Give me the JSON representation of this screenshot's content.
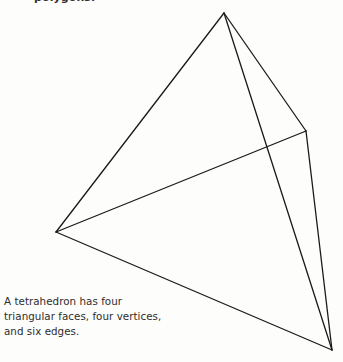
{
  "page": {
    "background_color": "#fdfdfc",
    "width": 343,
    "height": 362
  },
  "heading": {
    "text": "polygons.",
    "note": "clipped at top edge of image"
  },
  "figure": {
    "name": "tetrahedron-wireframe",
    "stroke_color": "#1a1a1a",
    "stroke_width": 1.3,
    "vertices": {
      "apex": {
        "label": "apex",
        "x": 224,
        "y": 13
      },
      "left": {
        "label": "left",
        "x": 56,
        "y": 232
      },
      "right": {
        "label": "right",
        "x": 306,
        "y": 131
      },
      "bottom_right": {
        "label": "bottom-right",
        "x": 332,
        "y": 350
      }
    },
    "edges": [
      {
        "name": "apex-to-left",
        "from": "apex",
        "to": "left"
      },
      {
        "name": "apex-to-right",
        "from": "apex",
        "to": "right"
      },
      {
        "name": "apex-to-bottom-right",
        "from": "apex",
        "to": "bottom_right"
      },
      {
        "name": "left-to-right",
        "from": "left",
        "to": "right"
      },
      {
        "name": "left-to-bottom-right",
        "from": "left",
        "to": "bottom_right"
      },
      {
        "name": "right-to-bottom-right",
        "from": "right",
        "to": "bottom_right"
      }
    ]
  },
  "caption": {
    "lines": [
      "A tetrahedron has four",
      "triangular faces, four vertices,",
      "and six edges."
    ]
  }
}
